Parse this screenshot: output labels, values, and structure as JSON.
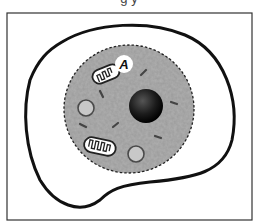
{
  "figure": {
    "cropped_caption_fragment": "g y",
    "type": "cell diagram",
    "labels": [
      {
        "text": "A",
        "points_to": "mitochondrion"
      }
    ],
    "structures": [
      "outer-membrane",
      "cytoplasm-region",
      "nucleus",
      "mitochondrion",
      "mitochondrion",
      "vacuole",
      "vacuole",
      "small-organelle-dashes"
    ],
    "colors": {
      "frame": "#333333",
      "membrane": "#111111",
      "cytoplasm": "#9a9a9a",
      "nucleus": "#1a1a1a",
      "vacuole_fill": "#c8c8c8",
      "vacuole_stroke": "#4a4a4a",
      "label_bg": "#ffffff"
    }
  }
}
